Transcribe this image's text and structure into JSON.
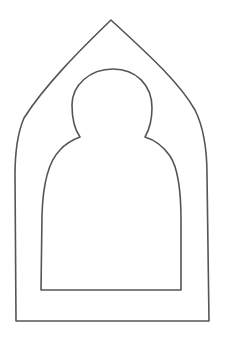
{
  "figure": {
    "background_color": "#ffffff",
    "stroke_color": "#555555",
    "stroke_width": 1.6,
    "shapes": {
      "outer_frame": {
        "type": "pointed-arch",
        "apex": [
          111,
          20
        ],
        "bottom_left": [
          16,
          321
        ],
        "bottom_right": [
          209,
          321
        ]
      },
      "inner_bust": {
        "type": "head-and-shoulders",
        "head_top": [
          113,
          69
        ],
        "bottom_left": [
          41,
          290
        ],
        "bottom_right": [
          181,
          290
        ]
      }
    }
  }
}
